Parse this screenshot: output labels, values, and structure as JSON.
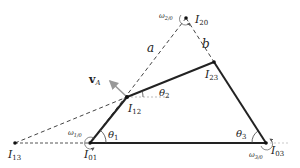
{
  "diagram": {
    "type": "four-bar linkage instant centers",
    "points": {
      "I01": {
        "label": "I",
        "sub": "01",
        "x": 90,
        "y": 143
      },
      "I03": {
        "label": "I",
        "sub": "03",
        "x": 266,
        "y": 143
      },
      "I12": {
        "label": "I",
        "sub": "12",
        "x": 127,
        "y": 97
      },
      "I23": {
        "label": "I",
        "sub": "23",
        "x": 214,
        "y": 62
      },
      "I20": {
        "label": "I",
        "sub": "20",
        "x": 186,
        "y": 18
      },
      "I13": {
        "label": "I",
        "sub": "13",
        "x": 15,
        "y": 143
      }
    },
    "line_labels": {
      "a": "a",
      "b": "b"
    },
    "angles": {
      "theta1": "θ",
      "theta1_sub": "1",
      "theta2": "θ",
      "theta2_sub": "2",
      "theta3": "θ",
      "theta3_sub": "3"
    },
    "omegas": {
      "w10": "ω",
      "w10_sub": "1/0",
      "w20": "ω",
      "w20_sub": "2/0",
      "w30": "ω",
      "w30_sub": "3/0"
    },
    "velocity": {
      "label": "v",
      "sub": "A"
    },
    "colors": {
      "link": "#222222",
      "dashed": "#444444",
      "vector": "#999999"
    }
  }
}
